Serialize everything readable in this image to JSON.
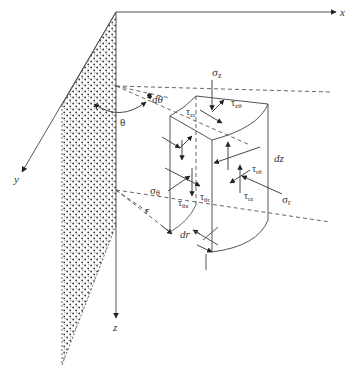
{
  "figure": {
    "axes": {
      "x": "x",
      "y": "y",
      "z": "z"
    },
    "angles": {
      "theta": "θ",
      "dtheta": "dθ"
    },
    "dimensions": {
      "r": "r",
      "dr": "dr",
      "dz": "dz"
    },
    "stresses": {
      "sigma_z": "σ",
      "sigma_z_sub": "z",
      "sigma_r": "σ",
      "sigma_r_sub": "r",
      "sigma_theta": "σ",
      "sigma_theta_sub": "θ",
      "tau_zr": "τ",
      "tau_zr_sub": "zr",
      "tau_ztheta": "τ",
      "tau_ztheta_sub": "zθ",
      "tau_rtheta": "τ",
      "tau_rtheta_sub": "rθ",
      "tau_rz": "τ",
      "tau_rz_sub": "rz",
      "tau_thetar": "τ",
      "tau_thetar_sub": "θr",
      "tau_thetaz": "τ",
      "tau_thetaz_sub": "θz"
    }
  }
}
